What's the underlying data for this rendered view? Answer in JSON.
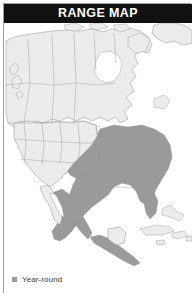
{
  "panel": {
    "title": "RANGE MAP"
  },
  "legend": {
    "items": [
      {
        "label": "Year-round",
        "color": "#9a9a9a",
        "swatch_name": "year-round-swatch"
      }
    ]
  },
  "map": {
    "region": "North America",
    "land_color": "#ececec",
    "range_color": "#9a9a9a",
    "water_color": "#ffffff",
    "outline_color": "#8e8e8e"
  },
  "colors": {
    "title_bar_background": "#111111",
    "title_text": "#ffffff",
    "frame_border": "#9d9d9d",
    "page_background": "#ffffff",
    "legend_text": "#3a3a3a"
  }
}
